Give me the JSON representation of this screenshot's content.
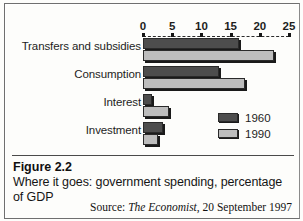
{
  "chart_data": {
    "type": "bar",
    "orientation": "horizontal",
    "title": "",
    "xlabel": "",
    "ylabel": "",
    "xlim": [
      0,
      25
    ],
    "xticks": [
      0,
      5,
      10,
      15,
      20,
      25
    ],
    "grid": false,
    "legend_position": "inside-bottom-right",
    "categories": [
      "Transfers and subsidies",
      "Consumption",
      "Interest",
      "Investment"
    ],
    "series": [
      {
        "name": "1960",
        "color": "#4d4d4d",
        "values": [
          16.5,
          13,
          1.5,
          3.5
        ]
      },
      {
        "name": "1990",
        "color": "#bdbdbd",
        "values": [
          22.5,
          17.5,
          4.5,
          2.5
        ]
      }
    ]
  },
  "legend": {
    "entries": [
      {
        "label": "1960",
        "color": "#4d4d4d"
      },
      {
        "label": "1990",
        "color": "#bdbdbd"
      }
    ]
  },
  "caption": {
    "figure_number": "Figure 2.2",
    "description": "Where it goes: government spending, percentage of GDP"
  },
  "source": {
    "prefix": "Source:",
    "publication": "The Economist",
    "date": ", 20 September 1997"
  }
}
